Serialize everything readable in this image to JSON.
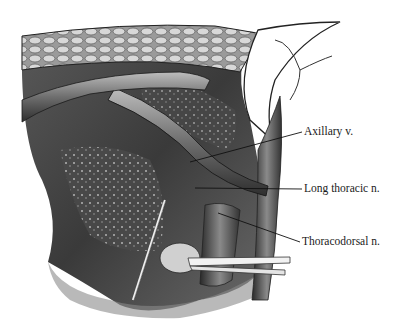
{
  "figure": {
    "labels": [
      {
        "id": "axillary-vein",
        "text": "Axillary v."
      },
      {
        "id": "long-thoracic-nerve",
        "text": "Long thoracic n."
      },
      {
        "id": "thoracodorsal-nerve",
        "text": "Thoracodorsal n."
      }
    ]
  }
}
